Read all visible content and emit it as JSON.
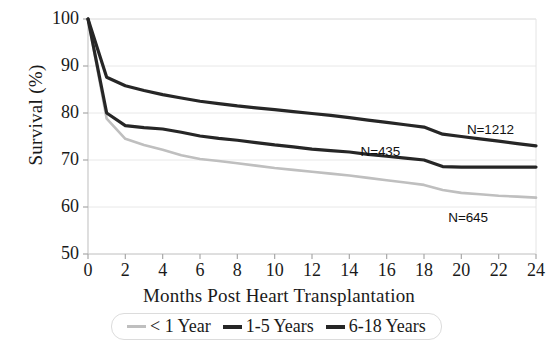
{
  "chart_data": {
    "type": "line",
    "title": "",
    "xlabel": "Months Post Heart Transplantation",
    "ylabel": "Survival (%)",
    "xlim": [
      0,
      24
    ],
    "ylim": [
      50,
      100
    ],
    "xticks": [
      "0",
      "2",
      "4",
      "6",
      "8",
      "10",
      "12",
      "14",
      "16",
      "18",
      "20",
      "22",
      "24"
    ],
    "yticks": [
      "50",
      "60",
      "70",
      "80",
      "90",
      "100"
    ],
    "grid": true,
    "legend_position": "bottom",
    "x": [
      0,
      1,
      2,
      3,
      4,
      5,
      6,
      7,
      8,
      9,
      10,
      11,
      12,
      13,
      14,
      15,
      16,
      17,
      18,
      19,
      20,
      21,
      22,
      23,
      24
    ],
    "series": [
      {
        "name": "< 1 Year",
        "color": "#bfbfbf",
        "annotation": "N=645",
        "values": [
          100,
          78.8,
          74.5,
          73.2,
          72.2,
          71.0,
          70.2,
          69.8,
          69.3,
          68.8,
          68.3,
          67.9,
          67.5,
          67.1,
          66.7,
          66.2,
          65.7,
          65.2,
          64.7,
          63.6,
          63.0,
          62.7,
          62.4,
          62.2,
          62.0
        ]
      },
      {
        "name": "1-5 Years",
        "color": "#262626",
        "annotation": "N=435",
        "values": [
          100,
          80.0,
          77.3,
          76.9,
          76.6,
          75.9,
          75.1,
          74.6,
          74.2,
          73.7,
          73.2,
          72.8,
          72.3,
          72.0,
          71.7,
          71.2,
          70.8,
          70.4,
          70.0,
          68.6,
          68.5,
          68.5,
          68.5,
          68.5,
          68.5
        ]
      },
      {
        "name": "6-18 Years",
        "color": "#262626",
        "annotation": "N=1212",
        "values": [
          100,
          87.6,
          85.8,
          84.8,
          83.9,
          83.2,
          82.5,
          82.0,
          81.5,
          81.1,
          80.7,
          80.3,
          79.9,
          79.5,
          79.0,
          78.5,
          78.0,
          77.5,
          77.0,
          75.5,
          75.0,
          74.5,
          74.0,
          73.5,
          73.0
        ]
      }
    ],
    "annotations": [
      {
        "text": "N=1212",
        "x": 20.3,
        "y": 76.4
      },
      {
        "text": "N=435",
        "x": 14.6,
        "y": 71.7
      },
      {
        "text": "N=645",
        "x": 19.3,
        "y": 57.6
      }
    ]
  },
  "legend": {
    "items": [
      {
        "label": "< 1 Year",
        "color": "#bfbfbf",
        "thickness": 3
      },
      {
        "label": "1-5 Years",
        "color": "#262626",
        "thickness": 4
      },
      {
        "label": "6-18 Years",
        "color": "#262626",
        "thickness": 4
      }
    ]
  }
}
